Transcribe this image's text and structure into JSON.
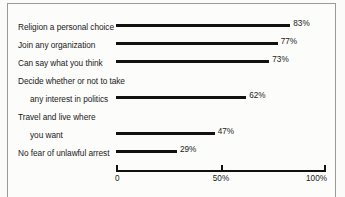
{
  "chart_data": {
    "type": "bar",
    "orientation": "horizontal",
    "title": "",
    "subtitle": "",
    "xlabel": "",
    "ylabel": "",
    "xlim": [
      0,
      100
    ],
    "grid": false,
    "legend": null,
    "categories": [
      "Religion a personal choice",
      "Join any organization",
      "Can say what you think",
      "Decide whether or not to take any interest in politics",
      "Travel and live where you want",
      "No fear of unlawful arrest"
    ],
    "values": [
      83,
      77,
      73,
      62,
      47,
      29
    ],
    "value_labels": [
      "83%",
      "77%",
      "73%",
      "62%",
      "47%",
      "29%"
    ],
    "xticks": [
      0,
      50,
      100
    ],
    "xtick_labels": [
      "0",
      "50%",
      "100%"
    ],
    "bar_color": "#111111",
    "background_color": "#fbfbfa",
    "axis_color": "#111111"
  },
  "rows": [
    {
      "lines": [
        "Religion a personal choice"
      ],
      "value_label": "83%"
    },
    {
      "lines": [
        "Join any organization"
      ],
      "value_label": "77%"
    },
    {
      "lines": [
        "Can say what you think"
      ],
      "value_label": "73%"
    },
    {
      "lines": [
        "Decide whether or not to take",
        "any interest in politics"
      ],
      "value_label": "62%"
    },
    {
      "lines": [
        "Travel and live where",
        "you want"
      ],
      "value_label": "47%"
    },
    {
      "lines": [
        "No fear of unlawful arrest"
      ],
      "value_label": "29%"
    }
  ],
  "axis": {
    "start": "0",
    "mid": "50%",
    "end": "100%"
  }
}
